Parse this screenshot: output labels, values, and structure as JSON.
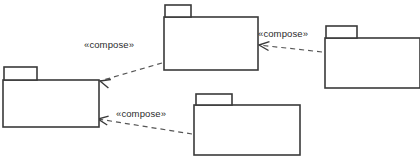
{
  "diagram": {
    "type": "uml-package-diagram",
    "width": 420,
    "height": 166,
    "background_color": "#ffffff",
    "line_color": "#3a3a3a",
    "dashed_line_color": "#555555",
    "text_color": "#2b2b2b",
    "packages": [
      {
        "id": "package-top-center",
        "label": "",
        "tab": {
          "x": 165,
          "y": 5,
          "w": 26,
          "h": 12
        },
        "body": {
          "x": 164,
          "y": 17,
          "w": 94,
          "h": 53
        }
      },
      {
        "id": "package-top-right",
        "label": "",
        "tab": {
          "x": 326,
          "y": 26,
          "w": 31,
          "h": 12
        },
        "body": {
          "x": 325,
          "y": 38,
          "w": 95,
          "h": 50
        }
      },
      {
        "id": "package-left",
        "label": "",
        "tab": {
          "x": 4,
          "y": 67,
          "w": 33,
          "h": 13
        },
        "body": {
          "x": 3,
          "y": 80,
          "w": 96,
          "h": 47
        }
      },
      {
        "id": "package-bottom-center",
        "label": "",
        "tab": {
          "x": 196,
          "y": 94,
          "w": 36,
          "h": 11
        },
        "body": {
          "x": 194,
          "y": 105,
          "w": 106,
          "h": 50
        }
      }
    ],
    "dependencies": [
      {
        "id": "dependency-top-center-to-left",
        "label": "«compose»",
        "label_x": 84,
        "label_y": 48,
        "from": "package-top-center",
        "to": "package-left",
        "start_x": 162,
        "start_y": 63,
        "end_x": 100,
        "end_y": 81,
        "arrow_angle_deg": 196
      },
      {
        "id": "dependency-top-right-to-top-center",
        "label": "«compose»",
        "label_x": 258,
        "label_y": 37,
        "from": "package-top-right",
        "to": "package-top-center",
        "start_x": 322,
        "start_y": 52,
        "end_x": 259,
        "end_y": 45,
        "arrow_angle_deg": 186
      },
      {
        "id": "dependency-bottom-center-to-left",
        "label": "«compose»",
        "label_x": 116,
        "label_y": 117,
        "from": "package-bottom-center",
        "to": "package-left",
        "start_x": 192,
        "start_y": 134,
        "end_x": 98,
        "end_y": 119,
        "arrow_angle_deg": 189
      }
    ]
  }
}
